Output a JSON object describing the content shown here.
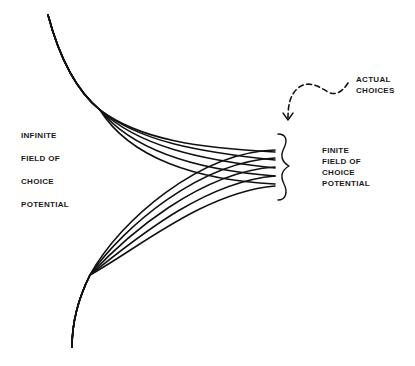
{
  "diagram": {
    "left_labels": [
      "INFINITE",
      "FIELD  OF",
      "CHOICE",
      "POTENTIAL"
    ],
    "right_labels": [
      "FINITE",
      "FIELD  OF",
      "CHOICE",
      "POTENTIAL"
    ],
    "callout_labels": [
      "ACTUAL",
      "CHOICES"
    ],
    "stroke_color": "#111111",
    "background_color": "#ffffff",
    "upper_strand_count": 5,
    "lower_strand_count": 5,
    "icons": {
      "callout_arrow": "dashed-curved-arrow-icon",
      "brace": "curly-brace-icon"
    }
  }
}
